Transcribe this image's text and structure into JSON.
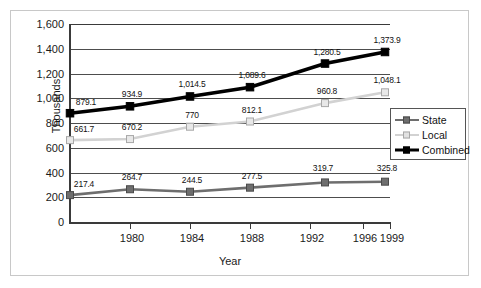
{
  "chart_data": {
    "type": "line",
    "title": "",
    "xlabel": "Year",
    "ylabel": "Thousands",
    "ylim": [
      0,
      1600
    ],
    "ytick_labels": [
      "1,600",
      "1,400",
      "1,200",
      "1,000",
      "800",
      "600",
      "400",
      "200",
      "0"
    ],
    "ytick_values": [
      1600,
      1400,
      1200,
      1000,
      800,
      600,
      400,
      200,
      0
    ],
    "xtick_labels": [
      "1980",
      "1984",
      "1988",
      "1992",
      "1996",
      "1999"
    ],
    "grid": true,
    "legend_position": "right-middle",
    "x": [
      1977,
      1980,
      1985,
      1990,
      1995,
      1999
    ],
    "series": [
      {
        "name": "State",
        "color": "#6e6e6e",
        "values": [
          217.4,
          264.7,
          244.5,
          277.5,
          319.7,
          325.8
        ],
        "labels": [
          "217.4",
          "264.7",
          "244.5",
          "277.5",
          "319.7",
          "325.8"
        ]
      },
      {
        "name": "Local",
        "color": "#c9c9c9",
        "values": [
          661.7,
          670.2,
          770,
          812.1,
          960.8,
          1048.1
        ],
        "labels": [
          "661.7",
          "670.2",
          "770",
          "812.1",
          "960.8",
          "1,048.1"
        ]
      },
      {
        "name": "Combined",
        "color": "#000000",
        "values": [
          879.1,
          934.9,
          1014.5,
          1089.6,
          1280.5,
          1373.9
        ],
        "labels": [
          "879.1",
          "934.9",
          "1,014.5",
          "1,089.6",
          "1,280.5",
          "1,373.9"
        ]
      }
    ]
  },
  "legend": {
    "items": [
      {
        "label": "State"
      },
      {
        "label": "Local"
      },
      {
        "label": "Combined"
      }
    ]
  }
}
